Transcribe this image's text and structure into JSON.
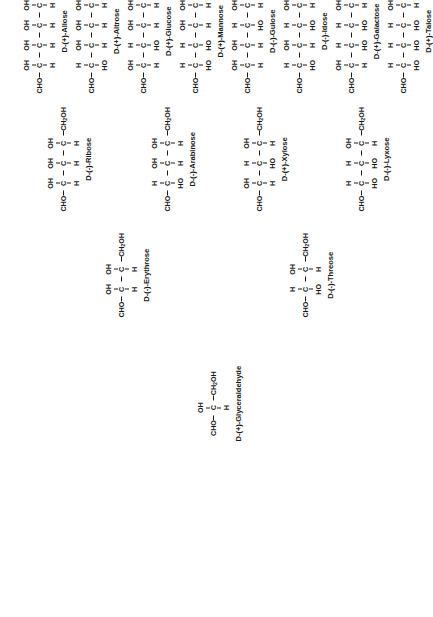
{
  "diagram": {
    "type": "chemical-structure-tree",
    "rotation_deg": -90,
    "atoms": {
      "cho": "CHO",
      "ch2oh_text": "CH",
      "ch2oh_sub": "2",
      "ch2oh_tail": "OH",
      "carbon": "C",
      "h": "H",
      "oh": "OH",
      "ho": "HO"
    }
  },
  "chart_data": {
    "type": "tree",
    "note": "Fischer projections. 'OH' on the right = H on the left; 'HO' on the left = OH on the left.",
    "levels": [
      "triose",
      "tetrose",
      "pentose",
      "hexose"
    ],
    "nodes": [
      {
        "id": "glyceraldehyde",
        "name": "D-(+)-Glyceraldehyde",
        "carbons": 3,
        "level": "triose",
        "stereo": [
          "R"
        ],
        "top": [
          "OH"
        ],
        "bottom": [
          "H"
        ]
      },
      {
        "id": "erythrose",
        "name": "D-(-)-Erythrose",
        "carbons": 4,
        "level": "tetrose",
        "stereo": [
          "R",
          "R"
        ],
        "top": [
          "OH",
          "OH"
        ],
        "bottom": [
          "H",
          "H"
        ]
      },
      {
        "id": "threose",
        "name": "D-(-)-Threose",
        "carbons": 4,
        "level": "tetrose",
        "stereo": [
          "L",
          "R"
        ],
        "top": [
          "H",
          "OH"
        ],
        "bottom": [
          "HO",
          "H"
        ]
      },
      {
        "id": "ribose",
        "name": "D-(-)-Ribose",
        "carbons": 5,
        "level": "pentose",
        "stereo": [
          "R",
          "R",
          "R"
        ],
        "top": [
          "OH",
          "OH",
          "OH"
        ],
        "bottom": [
          "H",
          "H",
          "H"
        ]
      },
      {
        "id": "arabinose",
        "name": "D-(-)-Arabinose",
        "carbons": 5,
        "level": "pentose",
        "stereo": [
          "L",
          "R",
          "R"
        ],
        "top": [
          "H",
          "OH",
          "OH"
        ],
        "bottom": [
          "HO",
          "H",
          "H"
        ]
      },
      {
        "id": "xylose",
        "name": "D-(+)-Xylose",
        "carbons": 5,
        "level": "pentose",
        "stereo": [
          "R",
          "L",
          "R"
        ],
        "top": [
          "OH",
          "H",
          "OH"
        ],
        "bottom": [
          "H",
          "HO",
          "H"
        ]
      },
      {
        "id": "lyxose",
        "name": "D-(-)-Lyxose",
        "carbons": 5,
        "level": "pentose",
        "stereo": [
          "L",
          "L",
          "R"
        ],
        "top": [
          "H",
          "H",
          "OH"
        ],
        "bottom": [
          "HO",
          "HO",
          "H"
        ]
      },
      {
        "id": "allose",
        "name": "D-(+)-Allose",
        "carbons": 6,
        "level": "hexose",
        "stereo": [
          "R",
          "R",
          "R",
          "R"
        ],
        "top": [
          "OH",
          "OH",
          "OH",
          "OH"
        ],
        "bottom": [
          "H",
          "H",
          "H",
          "H"
        ]
      },
      {
        "id": "altrose",
        "name": "D-(+)-Altrose",
        "carbons": 6,
        "level": "hexose",
        "stereo": [
          "L",
          "R",
          "R",
          "R"
        ],
        "top": [
          "H",
          "OH",
          "OH",
          "OH"
        ],
        "bottom": [
          "HO",
          "H",
          "H",
          "H"
        ]
      },
      {
        "id": "glucose",
        "name": "D-(+)-Glucose",
        "carbons": 6,
        "level": "hexose",
        "stereo": [
          "R",
          "L",
          "R",
          "R"
        ],
        "top": [
          "OH",
          "H",
          "OH",
          "OH"
        ],
        "bottom": [
          "H",
          "HO",
          "H",
          "H"
        ]
      },
      {
        "id": "mannose",
        "name": "D-(+)-Mannose",
        "carbons": 6,
        "level": "hexose",
        "stereo": [
          "L",
          "L",
          "R",
          "R"
        ],
        "top": [
          "H",
          "H",
          "OH",
          "OH"
        ],
        "bottom": [
          "HO",
          "HO",
          "H",
          "H"
        ]
      },
      {
        "id": "gulose",
        "name": "D-(-)-Gulose",
        "carbons": 6,
        "level": "hexose",
        "stereo": [
          "R",
          "R",
          "L",
          "R"
        ],
        "top": [
          "OH",
          "OH",
          "H",
          "OH"
        ],
        "bottom": [
          "H",
          "H",
          "HO",
          "H"
        ]
      },
      {
        "id": "idose",
        "name": "D-(-)-Idose",
        "carbons": 6,
        "level": "hexose",
        "stereo": [
          "L",
          "R",
          "L",
          "R"
        ],
        "top": [
          "H",
          "OH",
          "H",
          "OH"
        ],
        "bottom": [
          "HO",
          "H",
          "HO",
          "H"
        ]
      },
      {
        "id": "galactose",
        "name": "D-(+)-Galactose",
        "carbons": 6,
        "level": "hexose",
        "stereo": [
          "R",
          "L",
          "L",
          "R"
        ],
        "top": [
          "OH",
          "H",
          "H",
          "OH"
        ],
        "bottom": [
          "H",
          "HO",
          "HO",
          "H"
        ]
      },
      {
        "id": "talose",
        "name": "D-(+)-Talose",
        "carbons": 6,
        "level": "hexose",
        "stereo": [
          "L",
          "L",
          "L",
          "R"
        ],
        "top": [
          "H",
          "H",
          "H",
          "OH"
        ],
        "bottom": [
          "HO",
          "HO",
          "HO",
          "H"
        ]
      }
    ],
    "layout": [
      {
        "id": "glyceraldehyde",
        "x": 176,
        "y": 196
      },
      {
        "id": "erythrose",
        "x": 300,
        "y": 104
      },
      {
        "id": "threose",
        "x": 300,
        "y": 288
      },
      {
        "id": "ribose",
        "x": 406,
        "y": 46
      },
      {
        "id": "arabinose",
        "x": 406,
        "y": 150
      },
      {
        "id": "xylose",
        "x": 406,
        "y": 242
      },
      {
        "id": "lyxose",
        "x": 406,
        "y": 344
      },
      {
        "id": "allose",
        "x": 524,
        "y": 22
      },
      {
        "id": "altrose",
        "x": 524,
        "y": 74
      },
      {
        "id": "glucose",
        "x": 524,
        "y": 126
      },
      {
        "id": "mannose",
        "x": 524,
        "y": 178
      },
      {
        "id": "gulose",
        "x": 524,
        "y": 230
      },
      {
        "id": "idose",
        "x": 524,
        "y": 282
      },
      {
        "id": "galactose",
        "x": 524,
        "y": 334
      },
      {
        "id": "talose",
        "x": 524,
        "y": 386
      }
    ]
  }
}
